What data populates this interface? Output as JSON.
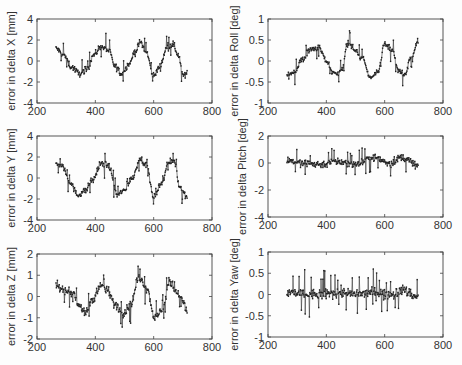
{
  "figure": {
    "background": "#fdfdfd",
    "line_color": "#222222",
    "axis_color": "#444444"
  },
  "chart_data": [
    {
      "id": "dx",
      "type": "line",
      "ylabel": "error in delta X  [mm]",
      "xlim": [
        200,
        800
      ],
      "ylim": [
        -4,
        4
      ],
      "xticks": [
        200,
        400,
        600,
        800
      ],
      "yticks": [
        -4,
        -2,
        0,
        2,
        4
      ],
      "box": {
        "x0": 37,
        "x1": 212,
        "y0": 19,
        "y1": 103
      },
      "noise": 0.55,
      "x": [
        265,
        290,
        320,
        345,
        370,
        395,
        420,
        445,
        470,
        490,
        515,
        535,
        555,
        575,
        600,
        620,
        645,
        665,
        685,
        700,
        715
      ],
      "values": [
        1.2,
        0.6,
        -0.6,
        -1.2,
        -0.8,
        0.6,
        1.4,
        1.0,
        -0.6,
        -1.2,
        -0.3,
        0.8,
        1.8,
        0.8,
        -1.4,
        -0.6,
        1.2,
        1.6,
        0.6,
        -1.4,
        -1.2
      ],
      "grid": false
    },
    {
      "id": "droll",
      "type": "line",
      "ylabel": "error in delta Roll  [deg]",
      "xlim": [
        200,
        800
      ],
      "ylim": [
        -1,
        1
      ],
      "xticks": [
        200,
        400,
        600,
        800
      ],
      "yticks": [
        -1,
        -0.5,
        0,
        0.5,
        1
      ],
      "ytick_labels": [
        "-1",
        "-0.5",
        "0",
        "0.5",
        "1"
      ],
      "box": {
        "x0": 268,
        "x1": 443,
        "y0": 19,
        "y1": 103
      },
      "noise": 0.13,
      "x": [
        265,
        290,
        320,
        350,
        375,
        400,
        425,
        450,
        475,
        500,
        525,
        550,
        575,
        600,
        625,
        650,
        670,
        690,
        715
      ],
      "values": [
        -0.35,
        -0.25,
        0.05,
        0.3,
        0.3,
        0.0,
        -0.3,
        -0.25,
        0.45,
        0.25,
        0.05,
        -0.4,
        -0.3,
        0.4,
        0.25,
        -0.25,
        -0.35,
        0.1,
        0.45
      ],
      "grid": false
    },
    {
      "id": "dy",
      "type": "line",
      "ylabel": "error in delta Y [mm]",
      "xlim": [
        200,
        800
      ],
      "ylim": [
        -4,
        4
      ],
      "xticks": [
        200,
        400,
        600,
        800
      ],
      "yticks": [
        -4,
        -2,
        0,
        2,
        4
      ],
      "box": {
        "x0": 37,
        "x1": 212,
        "y0": 136,
        "y1": 220
      },
      "noise": 0.55,
      "x": [
        265,
        290,
        310,
        340,
        365,
        390,
        420,
        445,
        475,
        500,
        525,
        555,
        575,
        600,
        625,
        650,
        670,
        690,
        715
      ],
      "values": [
        1.4,
        1.0,
        -0.3,
        -1.6,
        -1.2,
        -0.2,
        1.4,
        1.2,
        -1.6,
        -1.2,
        0.0,
        1.8,
        1.2,
        -1.8,
        -0.6,
        1.4,
        1.6,
        -0.8,
        -1.8
      ],
      "grid": false
    },
    {
      "id": "dpitch",
      "type": "line",
      "ylabel": "error in delta Pitch [deg]",
      "xlim": [
        200,
        800
      ],
      "ylim": [
        -4,
        2
      ],
      "xticks": [
        200,
        400,
        600,
        800
      ],
      "yticks": [
        -4,
        -2,
        0,
        2
      ],
      "box": {
        "x0": 268,
        "x1": 443,
        "y0": 136,
        "y1": 217
      },
      "noise": 0.5,
      "x": [
        265,
        320,
        380,
        440,
        500,
        560,
        620,
        660,
        715
      ],
      "values": [
        0.2,
        0.0,
        -0.1,
        0.1,
        -0.1,
        0.4,
        0.0,
        0.4,
        -0.2
      ],
      "grid": false
    },
    {
      "id": "dz",
      "type": "line",
      "ylabel": "error in delta Z [mm]",
      "xlim": [
        200,
        800
      ],
      "ylim": [
        -2,
        2
      ],
      "xticks": [
        200,
        400,
        600,
        800
      ],
      "yticks": [
        -2,
        -1,
        0,
        1,
        2
      ],
      "box": {
        "x0": 37,
        "x1": 212,
        "y0": 254,
        "y1": 339
      },
      "noise": 0.35,
      "x": [
        265,
        290,
        320,
        345,
        365,
        390,
        415,
        440,
        470,
        495,
        520,
        550,
        575,
        605,
        630,
        655,
        680,
        700,
        715
      ],
      "values": [
        0.5,
        0.3,
        0.2,
        -0.4,
        -0.8,
        -0.2,
        0.5,
        0.3,
        -0.4,
        -0.8,
        -0.4,
        0.9,
        0.4,
        -1.0,
        -0.6,
        0.7,
        0.2,
        -0.2,
        -0.8
      ],
      "grid": false
    },
    {
      "id": "dyaw",
      "type": "line",
      "ylabel": "error in delta Yaw  [deg]",
      "xlim": [
        200,
        800
      ],
      "ylim": [
        -1,
        1
      ],
      "xticks": [
        200,
        400,
        600,
        800
      ],
      "yticks": [
        -1,
        -0.5,
        0,
        0.5,
        1
      ],
      "ytick_labels": [
        "-1",
        "-0.5",
        "0",
        "0.5",
        "1"
      ],
      "box": {
        "x0": 268,
        "x1": 443,
        "y0": 252,
        "y1": 337
      },
      "noise": 0.22,
      "x": [
        265,
        320,
        380,
        440,
        500,
        560,
        620,
        660,
        715
      ],
      "values": [
        0.05,
        0.0,
        0.0,
        0.05,
        0.0,
        0.05,
        0.0,
        0.1,
        -0.05
      ],
      "grid": false
    }
  ]
}
